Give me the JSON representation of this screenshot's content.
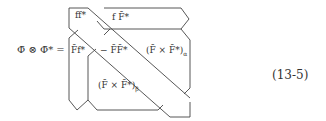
{
  "equation": {
    "lhs": "Φ̄ ⊗ Φ̄* =",
    "number": "(13-5)",
    "cells": {
      "ff": "ff*",
      "fF": "f F̄*",
      "Ff": "F̄f*",
      "FF": "− F̄F̄*",
      "cross_alpha": "(F̄ × F̄*)",
      "cross_alpha_sub": "α",
      "cross_beta": "(F̄ × F̄*)",
      "cross_beta_sub": "β"
    }
  }
}
